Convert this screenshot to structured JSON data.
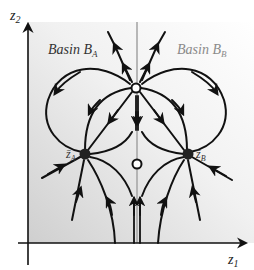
{
  "figure": {
    "axes": {
      "x_label": "z",
      "x_label_sub": "1",
      "y_label": "z",
      "y_label_sub": "2"
    },
    "regions": [
      {
        "id": "basin-a",
        "label": "Basin ",
        "script": "B",
        "sub": "A"
      },
      {
        "id": "basin-b",
        "label": "Basin ",
        "script": "B",
        "sub": "B"
      }
    ],
    "equilibria": [
      {
        "id": "node-a",
        "type": "stable-node",
        "label": "z̄",
        "sub": "A"
      },
      {
        "id": "node-b",
        "type": "stable-node",
        "label": "z̄",
        "sub": "B"
      },
      {
        "id": "saddle-top",
        "type": "saddle",
        "label": ""
      },
      {
        "id": "unstable-middle",
        "type": "unstable",
        "label": ""
      }
    ],
    "colors": {
      "trajectory": "#111111",
      "separatrix": "#a8a8a8",
      "basin_a_text": "#333333",
      "basin_b_text": "#8a8a8a",
      "bg_light": "#ffffff",
      "bg_dark": "#d2d2d2"
    }
  }
}
